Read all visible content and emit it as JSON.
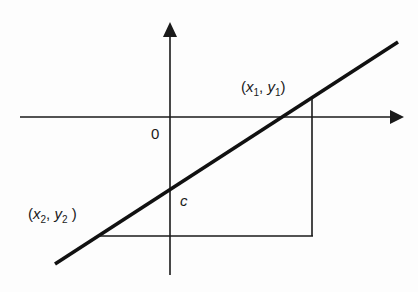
{
  "diagram": {
    "type": "coordinate-plane-line",
    "axes": {
      "origin_label": "0",
      "x_axis": "horizontal axis with arrow pointing right",
      "y_axis": "vertical axis with arrow pointing up"
    },
    "line": {
      "description": "straight line with positive slope",
      "y_intercept_label": "c"
    },
    "points": [
      {
        "id": "p1",
        "label_x": "x",
        "label_x_sub": "1",
        "label_y": "y",
        "label_y_sub": "1",
        "text": "(x1, y1)"
      },
      {
        "id": "p2",
        "label_x": "x",
        "label_x_sub": "2",
        "label_y": "y",
        "label_y_sub": "2",
        "text": "(x2, y2)"
      }
    ],
    "construction": "right triangle formed by horizontal line from (x2, y2) and vertical line from (x1, y1)",
    "colors": {
      "ink": "#1a1a1a",
      "background": "#ffffff"
    }
  },
  "labels": {
    "origin": "0",
    "intercept": "c",
    "p1": {
      "open": "(",
      "x": "x",
      "xsub": "1",
      "comma": ", ",
      "y": "y",
      "ysub": "1",
      "close": ")"
    },
    "p2": {
      "open": "(",
      "x": "x",
      "xsub": "2",
      "comma": ", ",
      "y": "y",
      "ysub": "2",
      "close": " )"
    }
  }
}
